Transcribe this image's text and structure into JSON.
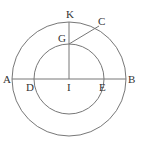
{
  "diagram": {
    "type": "geometry",
    "colors": {
      "stroke": "#777777",
      "label": "#333333",
      "background": "#ffffff"
    },
    "center": {
      "name": "I",
      "x": 69,
      "y": 79
    },
    "outer_circle": {
      "r": 57
    },
    "inner_circle": {
      "r": 35
    },
    "labels": {
      "K": "K",
      "C": "C",
      "G": "G",
      "A": "A",
      "D": "D",
      "I": "I",
      "E": "E",
      "B": "B"
    },
    "segments": [
      {
        "from": "A",
        "to": "B"
      },
      {
        "from": "I",
        "to": "K"
      },
      {
        "from": "G",
        "to": "C"
      }
    ]
  }
}
